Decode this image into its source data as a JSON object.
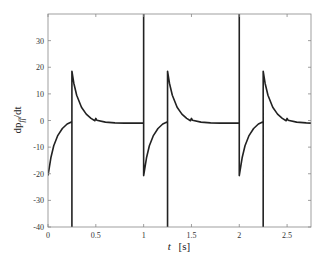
{
  "chart_data": {
    "type": "line",
    "title": "",
    "xlabel": "t [s]",
    "xlabel_parts": {
      "var": "t",
      "unit": "[s]"
    },
    "ylabel": "dp_ff/dt",
    "ylabel_parts": {
      "num": "dp",
      "sub": "ff",
      "den": "/dt"
    },
    "xlim": [
      0,
      2.75
    ],
    "ylim": [
      -40,
      40
    ],
    "xticks": [
      0,
      0.5,
      1,
      1.5,
      2,
      2.5
    ],
    "xtick_labels": [
      "0",
      "0.5",
      "1",
      "1.5",
      "2",
      "2.5"
    ],
    "yticks": [
      -40,
      -30,
      -20,
      -10,
      0,
      10,
      20,
      30
    ],
    "ytick_labels": [
      "-40",
      "-30",
      "-20",
      "-10",
      "0",
      "10",
      "20",
      "30"
    ],
    "grid": false,
    "legend": null,
    "line_color": "#222222",
    "series": [
      {
        "name": "dp_ff/dt",
        "description": "Periodic signal (period 1 s): jumps from ~-21 recovering to ~0 by t=0.25 (+k), vertical spike to -40, jump to ~19 decaying to ~0 with small bump at t=0.5 (+k), settling at ~-1; vertical spike to +40 at each integer second.",
        "x": [
          0,
          0.03,
          0.06,
          0.1,
          0.15,
          0.2,
          0.25,
          0.25,
          0.25,
          0.27,
          0.3,
          0.35,
          0.4,
          0.45,
          0.49,
          0.5,
          0.51,
          0.6,
          0.7,
          0.8,
          0.9,
          1.0,
          1.0,
          1.0,
          1.03,
          1.06,
          1.1,
          1.15,
          1.2,
          1.25,
          1.25,
          1.25,
          1.27,
          1.3,
          1.35,
          1.4,
          1.45,
          1.49,
          1.5,
          1.51,
          1.6,
          1.7,
          1.8,
          1.9,
          2.0,
          2.0,
          2.0,
          2.03,
          2.06,
          2.1,
          2.15,
          2.2,
          2.25,
          2.25,
          2.25,
          2.27,
          2.3,
          2.35,
          2.4,
          2.45,
          2.49,
          2.5,
          2.51,
          2.6,
          2.7,
          2.75
        ],
        "y": [
          -20.7,
          -14,
          -9.5,
          -5.8,
          -3,
          -1.3,
          -0.5,
          -40,
          18.5,
          14,
          9.5,
          5,
          2.4,
          0.8,
          -0.1,
          0.8,
          0.1,
          -0.6,
          -0.9,
          -1.0,
          -1.0,
          -1.0,
          40,
          -20.7,
          -14,
          -9.5,
          -5.8,
          -3,
          -1.3,
          -0.5,
          -40,
          18.5,
          14,
          9.5,
          5,
          2.4,
          0.8,
          -0.1,
          0.8,
          0.1,
          -0.6,
          -0.9,
          -1.0,
          -1.0,
          -1.0,
          40,
          -20.7,
          -14,
          -9.5,
          -5.8,
          -3,
          -1.3,
          -0.5,
          -40,
          18.5,
          14,
          9.5,
          5,
          2.4,
          0.8,
          -0.1,
          0.8,
          0.1,
          -0.6,
          -0.9,
          -1.0
        ]
      }
    ]
  }
}
